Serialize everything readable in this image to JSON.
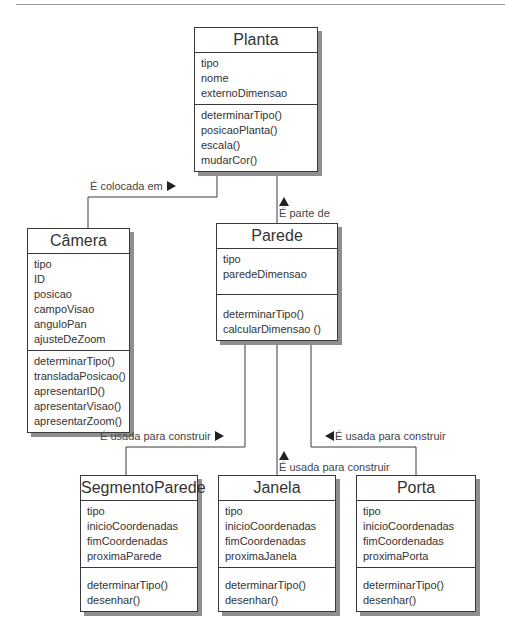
{
  "classes": {
    "planta": {
      "name": "Planta",
      "attributes": [
        "tipo",
        "nome",
        "externoDimensao"
      ],
      "methods": [
        "determinarTipo()",
        "posicaoPlanta()",
        "escala()",
        "mudarCor()"
      ]
    },
    "camera": {
      "name": "Câmera",
      "attributes": [
        "tipo",
        "ID",
        "posicao",
        "campoVisao",
        "anguloPan",
        "ajusteDeZoom"
      ],
      "methods": [
        "determinarTipo()",
        "transladaPosicao()",
        "apresentarID()",
        "apresentarVisao()",
        "apresentarZoom()"
      ]
    },
    "parede": {
      "name": "Parede",
      "attributes": [
        "tipo",
        "paredeDimensao"
      ],
      "methods": [
        "determinarTipo()",
        "calcularDimensao ()"
      ]
    },
    "segmentoParede": {
      "name": "SegmentoParede",
      "attributes": [
        "tipo",
        "inicioCoordenadas",
        "fimCoordenadas",
        "proximaParede"
      ],
      "methods": [
        "determinarTipo()",
        "desenhar()"
      ]
    },
    "janela": {
      "name": "Janela",
      "attributes": [
        "tipo",
        "inicioCoordenadas",
        "fimCoordenadas",
        "proximaJanela"
      ],
      "methods": [
        "determinarTipo()",
        "desenhar()"
      ]
    },
    "porta": {
      "name": "Porta",
      "attributes": [
        "tipo",
        "inicioCoordenadas",
        "fimCoordenadas",
        "proximaPorta"
      ],
      "methods": [
        "determinarTipo()",
        "desenhar()"
      ]
    }
  },
  "relations": {
    "camera_planta": {
      "label": "É colocada em",
      "arrow": "right"
    },
    "parede_planta": {
      "label": "É parte de",
      "arrow": "up"
    },
    "segmento_parede": {
      "label": "É usada para construir",
      "arrow": "right"
    },
    "janela_parede": {
      "label": "É usada para construir",
      "arrow": "up"
    },
    "porta_parede": {
      "label": "É usada para construir",
      "arrow": "left"
    }
  }
}
